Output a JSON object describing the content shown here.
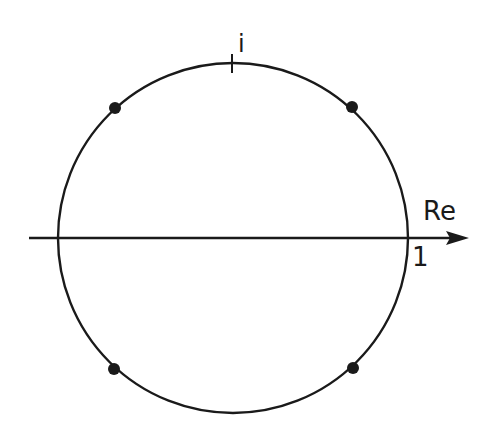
{
  "diagram": {
    "type": "complex-plane-unit-circle",
    "colors": {
      "background": "#ffffff",
      "stroke": "#1a1a1a",
      "points": "#1a1a1a"
    },
    "circle": {
      "cx": 233,
      "cy": 238,
      "r": 175
    },
    "real_axis": {
      "label": "Re",
      "x_start": 29,
      "x_end": 468,
      "y": 238
    },
    "labels": {
      "imag_unit": "i",
      "real_unit": "1",
      "axis": "Re"
    },
    "points": [
      {
        "name": "upper-left",
        "angle_deg": 135,
        "x": 115,
        "y": 108
      },
      {
        "name": "upper-right",
        "angle_deg": 45,
        "x": 352,
        "y": 107
      },
      {
        "name": "lower-left",
        "angle_deg": 225,
        "x": 114,
        "y": 369
      },
      {
        "name": "lower-right",
        "angle_deg": 315,
        "x": 353,
        "y": 368
      }
    ]
  }
}
